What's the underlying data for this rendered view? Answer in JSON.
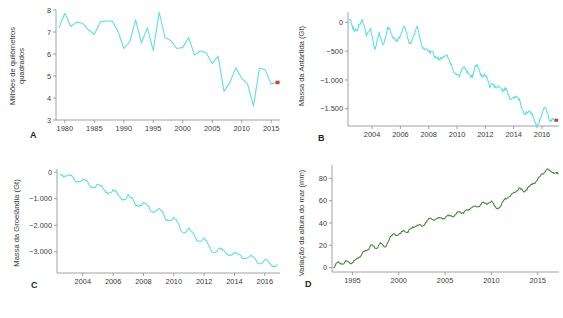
{
  "figure": {
    "background": "#ffffff",
    "panels": [
      "A",
      "B",
      "C",
      "D"
    ]
  },
  "colors": {
    "cyan": "#5fdfe8",
    "green": "#4a8c3f",
    "marker_red": "#c1452b",
    "axis": "#8a8a8a",
    "text": "#3b3b3b",
    "letter": "#231f20"
  },
  "panel_a": {
    "letter": "A",
    "ylabel_line1": "Milhões de quilómetros",
    "ylabel_line2": "quadrados",
    "yticks": [
      "3",
      "4",
      "5",
      "6",
      "7",
      "8"
    ],
    "xticks": [
      "1980",
      "1985",
      "1990",
      "1995",
      "2000",
      "2005",
      "2010",
      "2015"
    ]
  },
  "panel_b": {
    "letter": "B",
    "ylabel": "Massa da Antártida (Gt)",
    "yticks": [
      "0",
      "−500",
      "−1.000",
      "−1.500"
    ],
    "xticks": [
      "2004",
      "2006",
      "2008",
      "2010",
      "2012",
      "2014",
      "2016"
    ]
  },
  "panel_c": {
    "letter": "C",
    "ylabel": "Massa da Groelândia (Gt)",
    "yticks": [
      "0",
      "−1.000",
      "−2.000",
      "−3.000"
    ],
    "xticks": [
      "2004",
      "2006",
      "2008",
      "2010",
      "2012",
      "2014",
      "2016"
    ]
  },
  "panel_d": {
    "letter": "D",
    "ylabel": "Variação da altura do mar (mm)",
    "yticks": [
      "0",
      "20",
      "40",
      "60",
      "80"
    ],
    "xticks": [
      "1995",
      "2000",
      "2005",
      "2010",
      "2015"
    ]
  },
  "chart_data": [
    {
      "type": "line",
      "panel": "A",
      "title": "",
      "xlabel": "",
      "ylabel": "Milhões de quilómetros quadrados",
      "xlim": [
        1978.5,
        2016.5
      ],
      "ylim": [
        3,
        8
      ],
      "grid": false,
      "legend": null,
      "color": "#5fdfe8",
      "end_marker": {
        "x": 2016,
        "y": 4.72,
        "color": "#c1452b"
      },
      "x": [
        1979,
        1980,
        1981,
        1982,
        1983,
        1984,
        1985,
        1986,
        1987,
        1988,
        1989,
        1990,
        1991,
        1992,
        1993,
        1994,
        1995,
        1996,
        1997,
        1998,
        1999,
        2000,
        2001,
        2002,
        2003,
        2004,
        2005,
        2006,
        2007,
        2008,
        2009,
        2010,
        2011,
        2012,
        2013,
        2014,
        2015,
        2016
      ],
      "values": [
        7.2,
        7.85,
        7.25,
        7.45,
        7.4,
        7.1,
        6.9,
        7.45,
        7.5,
        7.5,
        7.05,
        6.25,
        6.55,
        7.55,
        6.5,
        7.2,
        6.15,
        7.9,
        6.75,
        6.6,
        6.25,
        6.3,
        6.75,
        5.95,
        6.15,
        6.05,
        5.57,
        5.9,
        4.3,
        4.7,
        5.38,
        4.9,
        4.63,
        3.63,
        5.35,
        5.28,
        4.63,
        4.72
      ]
    },
    {
      "type": "line",
      "panel": "B",
      "title": "",
      "xlabel": "",
      "ylabel": "Massa da Antártida (Gt)",
      "xlim": [
        2002.3,
        2017.2
      ],
      "ylim": [
        -1800,
        180
      ],
      "grid": false,
      "legend": null,
      "color": "#5fdfe8",
      "end_marker": {
        "x": 2017.0,
        "y": -1700,
        "color": "#c1452b"
      },
      "note": "monthly GRACE mass anomaly, declining trend with strong seasonal oscillation",
      "x": [
        2002.4,
        2002.7,
        2003.0,
        2003.3,
        2003.6,
        2003.9,
        2004.2,
        2004.5,
        2004.8,
        2005.1,
        2005.4,
        2005.7,
        2006.0,
        2006.3,
        2006.6,
        2006.9,
        2007.2,
        2007.5,
        2007.8,
        2008.1,
        2008.4,
        2008.7,
        2009.0,
        2009.3,
        2009.6,
        2009.9,
        2010.2,
        2010.5,
        2010.8,
        2011.1,
        2011.4,
        2011.7,
        2012.0,
        2012.3,
        2012.6,
        2012.9,
        2013.2,
        2013.5,
        2013.8,
        2014.1,
        2014.4,
        2014.7,
        2015.0,
        2015.3,
        2015.6,
        2015.9,
        2016.2,
        2016.5,
        2016.8,
        2017.0
      ],
      "values": [
        40,
        -60,
        -100,
        -30,
        -180,
        -60,
        -560,
        -170,
        -330,
        -120,
        -280,
        -250,
        -220,
        -120,
        -330,
        -230,
        -140,
        -420,
        -380,
        -560,
        -620,
        -570,
        -600,
        -620,
        -700,
        -870,
        -1000,
        -780,
        -820,
        -980,
        -760,
        -860,
        -900,
        -1180,
        -1050,
        -1060,
        -1250,
        -1160,
        -1280,
        -1320,
        -1390,
        -1500,
        -1560,
        -1650,
        -1780,
        -1620,
        -1520,
        -1680,
        -1620,
        -1700
      ]
    },
    {
      "type": "line",
      "panel": "C",
      "title": "",
      "xlabel": "",
      "ylabel": "Massa da Groelândia (Gt)",
      "xlim": [
        2002.3,
        2017.0
      ],
      "ylim": [
        -3800,
        120
      ],
      "grid": false,
      "legend": null,
      "color": "#5fdfe8",
      "end_marker": null,
      "note": "monthly GRACE mass anomaly with sawtooth seasonal cycle, steady decline",
      "x": [
        2002.5,
        2003.0,
        2003.5,
        2004.0,
        2004.5,
        2005.0,
        2005.5,
        2006.0,
        2006.5,
        2007.0,
        2007.5,
        2008.0,
        2008.5,
        2009.0,
        2009.5,
        2010.0,
        2010.5,
        2011.0,
        2011.5,
        2012.0,
        2012.5,
        2013.0,
        2013.5,
        2014.0,
        2014.5,
        2015.0,
        2015.5,
        2016.0,
        2016.5,
        2016.8
      ],
      "values": [
        -60,
        -120,
        -330,
        -250,
        -540,
        -450,
        -760,
        -680,
        -1000,
        -880,
        -1230,
        -1150,
        -1480,
        -1380,
        -1800,
        -1700,
        -2250,
        -2130,
        -2600,
        -2480,
        -3000,
        -2880,
        -3120,
        -3020,
        -3250,
        -3150,
        -3400,
        -3320,
        -3560,
        -3480
      ]
    },
    {
      "type": "line",
      "panel": "D",
      "title": "",
      "xlabel": "",
      "ylabel": "Variação da altura do mar (mm)",
      "xlim": [
        1992.8,
        2017.3
      ],
      "ylim": [
        -4,
        92
      ],
      "grid": false,
      "legend": null,
      "color": "#4a8c3f",
      "end_marker": null,
      "note": "satellite sea level rise, approximately linear with short term variability",
      "x": [
        1993.0,
        1993.5,
        1994.0,
        1994.5,
        1995.0,
        1995.5,
        1996.0,
        1996.5,
        1997.0,
        1997.5,
        1998.0,
        1998.5,
        1999.0,
        1999.5,
        2000.0,
        2000.5,
        2001.0,
        2001.5,
        2002.0,
        2002.5,
        2003.0,
        2003.5,
        2004.0,
        2004.5,
        2005.0,
        2005.5,
        2006.0,
        2006.5,
        2007.0,
        2007.5,
        2008.0,
        2008.5,
        2009.0,
        2009.5,
        2010.0,
        2010.5,
        2011.0,
        2011.5,
        2012.0,
        2012.5,
        2013.0,
        2013.5,
        2014.0,
        2014.5,
        2015.0,
        2015.5,
        2016.0,
        2016.5,
        2017.0,
        2017.2
      ],
      "values": [
        0,
        5,
        3,
        6,
        4,
        8,
        12,
        15,
        20,
        17,
        22,
        18,
        26,
        30,
        29,
        33,
        32,
        36,
        38,
        37,
        41,
        44,
        43,
        45,
        44,
        47,
        46,
        50,
        49,
        52,
        55,
        54,
        58,
        57,
        60,
        53,
        55,
        62,
        64,
        67,
        71,
        68,
        72,
        75,
        79,
        84,
        88,
        86,
        85,
        84
      ]
    }
  ]
}
